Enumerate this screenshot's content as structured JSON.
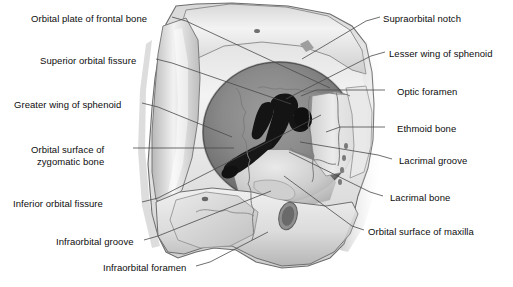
{
  "figure": {
    "bg_color": "#ffffff",
    "text_color": "#0d0d0d",
    "leader_color": "#4a4a4a",
    "bone_light": "#efefef",
    "bone_mid": "#c9c9c9",
    "bone_dark": "#9a9a9a",
    "cavity_dark": "#6f6f6f",
    "fissure_color": "#121212"
  },
  "labels": [
    {
      "id": "orbital-plate-of-frontal-bone",
      "text": "Orbital plate of frontal bone",
      "side": "left",
      "x": 31,
      "y": 13,
      "lines": 1
    },
    {
      "id": "superior-orbital-fissure",
      "text": "Superior orbital fissure",
      "side": "left",
      "x": 40,
      "y": 55,
      "lines": 1
    },
    {
      "id": "greater-wing-of-sphenoid",
      "text": "Greater wing of sphenoid",
      "side": "left",
      "x": 14,
      "y": 99,
      "lines": 1
    },
    {
      "id": "orbital-surface-of-zygomatic-bone",
      "text": "Orbital surface of\nzygomatic bone",
      "side": "left",
      "x": 31,
      "y": 144,
      "lines": 2
    },
    {
      "id": "inferior-orbital-fissure",
      "text": "Inferior orbital fissure",
      "side": "left",
      "x": 13,
      "y": 198,
      "lines": 1
    },
    {
      "id": "infraorbital-groove",
      "text": "Infraorbital groove",
      "side": "left",
      "x": 56,
      "y": 236,
      "lines": 1
    },
    {
      "id": "infraorbital-foramen",
      "text": "Infraorbital foramen",
      "side": "left",
      "x": 103,
      "y": 262,
      "lines": 1
    },
    {
      "id": "supraorbital-notch",
      "text": "Supraorbital notch",
      "side": "right",
      "x": 383,
      "y": 13,
      "lines": 1
    },
    {
      "id": "lesser-wing-of-sphenoid",
      "text": "Lesser wing of sphenoid",
      "side": "right",
      "x": 389,
      "y": 48,
      "lines": 1
    },
    {
      "id": "optic-foramen",
      "text": "Optic foramen",
      "side": "right",
      "x": 397,
      "y": 86,
      "lines": 1
    },
    {
      "id": "ethmoid-bone",
      "text": "Ethmoid bone",
      "side": "right",
      "x": 397,
      "y": 123,
      "lines": 1
    },
    {
      "id": "lacrimal-groove",
      "text": "Lacrimal groove",
      "side": "right",
      "x": 399,
      "y": 155,
      "lines": 1
    },
    {
      "id": "lacrimal-bone",
      "text": "Lacrimal bone",
      "side": "right",
      "x": 390,
      "y": 192,
      "lines": 1
    },
    {
      "id": "orbital-surface-of-maxilla",
      "text": "Orbital surface of maxilla",
      "side": "right",
      "x": 368,
      "y": 226,
      "lines": 1
    }
  ],
  "leaders": [
    {
      "id": "leader-orbital-plate-of-frontal-bone",
      "points": "172,17 186,21 330,88"
    },
    {
      "id": "leader-superior-orbital-fissure",
      "points": "156,59 172,63 291,104"
    },
    {
      "id": "leader-greater-wing-of-sphenoid",
      "points": "142,103 158,107 232,137"
    },
    {
      "id": "leader-orbital-surface-of-zygomatic-bone",
      "points": "133,148 151,148 234,148"
    },
    {
      "id": "leader-inferior-orbital-fissure",
      "points": "142,202 158,198 321,115"
    },
    {
      "id": "leader-infraorbital-groove",
      "points": "144,240 158,236 271,191"
    },
    {
      "id": "leader-infraorbital-foramen",
      "points": "196,266 210,262 268,232"
    },
    {
      "id": "leader-supraorbital-notch",
      "points": "380,17 366,21 302,59"
    },
    {
      "id": "leader-lesser-wing-of-sphenoid",
      "points": "385,52 371,56 286,99"
    },
    {
      "id": "leader-optic-foramen",
      "points": "385,90 316,90 301,96"
    },
    {
      "id": "leader-ethmoid-bone",
      "points": "385,127 340,127 326,132"
    },
    {
      "id": "leader-lacrimal-groove",
      "points": "392,159 378,155 300,142"
    },
    {
      "id": "leader-lacrimal-bone",
      "points": "383,196 370,192 289,152"
    },
    {
      "id": "leader-orbital-surface-of-maxilla",
      "points": "364,230 352,226 284,176"
    }
  ]
}
